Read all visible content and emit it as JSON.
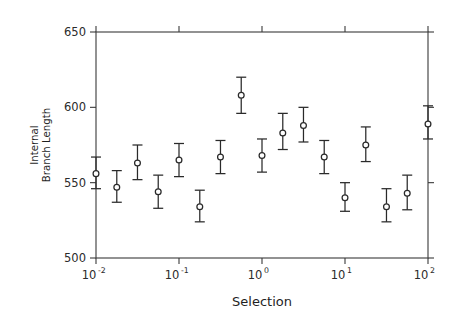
{
  "figure": {
    "background_color": "#ffffff",
    "line_color": "#2a2a2a",
    "width": 456,
    "height": 321
  },
  "chart_data": {
    "type": "scatter",
    "title": "",
    "xlabel": "Selection",
    "ylabel": "Internal Branch Length",
    "ylabel_lines": [
      "Internal",
      "Branch Length"
    ],
    "xscale": "log",
    "yscale": "linear",
    "xlim": [
      0.01,
      100
    ],
    "ylim": [
      500,
      650
    ],
    "grid": false,
    "legend": null,
    "xticklabels": [
      "10⁻²",
      "10⁻¹",
      "10⁰",
      "10¹",
      "10²"
    ],
    "xtick_bases": [
      "10",
      "10",
      "10",
      "10",
      "10"
    ],
    "xtick_exponents": [
      "-2",
      "-1",
      "0",
      "1",
      "2"
    ],
    "xticks": [
      0.01,
      0.1,
      1,
      10,
      100
    ],
    "yticks": [
      500,
      550,
      600,
      650
    ],
    "yticklabels": [
      "500",
      "550",
      "600",
      "650"
    ],
    "marker": "open-circle",
    "errorbar_style": "capped",
    "x": [
      0.01,
      0.0178,
      0.0316,
      0.0562,
      0.1,
      0.178,
      0.316,
      0.562,
      1.0,
      1.78,
      3.16,
      5.62,
      10.0,
      17.8,
      31.6,
      56.2,
      100.0
    ],
    "points": [
      {
        "x": 0.01,
        "y": 556,
        "yerr_low": 546,
        "yerr_high": 567
      },
      {
        "x": 0.0178,
        "y": 547,
        "yerr_low": 537,
        "yerr_high": 558
      },
      {
        "x": 0.0316,
        "y": 563,
        "yerr_low": 552,
        "yerr_high": 575
      },
      {
        "x": 0.0562,
        "y": 544,
        "yerr_low": 533,
        "yerr_high": 555
      },
      {
        "x": 0.1,
        "y": 565,
        "yerr_low": 554,
        "yerr_high": 576
      },
      {
        "x": 0.178,
        "y": 534,
        "yerr_low": 524,
        "yerr_high": 545
      },
      {
        "x": 0.316,
        "y": 567,
        "yerr_low": 556,
        "yerr_high": 578
      },
      {
        "x": 0.562,
        "y": 608,
        "yerr_low": 596,
        "yerr_high": 620
      },
      {
        "x": 1.0,
        "y": 568,
        "yerr_low": 557,
        "yerr_high": 579
      },
      {
        "x": 1.78,
        "y": 583,
        "yerr_low": 572,
        "yerr_high": 596
      },
      {
        "x": 3.16,
        "y": 588,
        "yerr_low": 577,
        "yerr_high": 600
      },
      {
        "x": 5.62,
        "y": 567,
        "yerr_low": 556,
        "yerr_high": 578
      },
      {
        "x": 10.0,
        "y": 540,
        "yerr_low": 531,
        "yerr_high": 550
      },
      {
        "x": 17.8,
        "y": 575,
        "yerr_low": 564,
        "yerr_high": 587
      },
      {
        "x": 31.6,
        "y": 534,
        "yerr_low": 524,
        "yerr_high": 546
      },
      {
        "x": 56.2,
        "y": 543,
        "yerr_low": 532,
        "yerr_high": 555
      },
      {
        "x": 100.0,
        "y": 589,
        "yerr_low": 579,
        "yerr_high": 601
      }
    ],
    "values": [
      556,
      547,
      563,
      544,
      565,
      534,
      567,
      608,
      568,
      583,
      588,
      567,
      540,
      575,
      534,
      543,
      589
    ]
  }
}
